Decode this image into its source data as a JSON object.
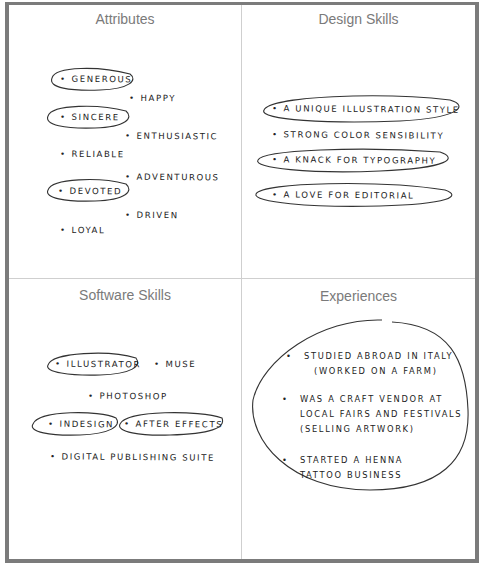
{
  "quadrants": {
    "attributes": {
      "title": "Attributes",
      "items": [
        "Generous",
        "Happy",
        "Sincere",
        "Enthusiastic",
        "Reliable",
        "Adventurous",
        "Devoted",
        "Driven",
        "Loyal"
      ],
      "circled": [
        "Generous",
        "Sincere",
        "Devoted"
      ]
    },
    "design_skills": {
      "title": "Design Skills",
      "items": [
        "A unique illustration style",
        "Strong color sensibility",
        "A knack for typography",
        "A love for editorial"
      ],
      "circled": [
        "A unique illustration style",
        "A knack for typography",
        "A love for editorial"
      ]
    },
    "software_skills": {
      "title": "Software Skills",
      "items": [
        "Illustrator",
        "Muse",
        "Photoshop",
        "InDesign",
        "After Effects",
        "Digital Publishing Suite"
      ],
      "circled": [
        "Illustrator",
        "InDesign",
        "After Effects"
      ]
    },
    "experiences": {
      "title": "Experiences",
      "items": [
        {
          "lines": [
            "Studied abroad in Italy",
            "(worked on a farm)"
          ]
        },
        {
          "lines": [
            "Was a craft vendor at",
            "local fairs and festivals",
            "(selling artwork)"
          ]
        },
        {
          "lines": [
            "Started a henna",
            "tattoo business"
          ]
        }
      ]
    }
  },
  "bullet": "•",
  "colors": {
    "frame": "#7b7b7b",
    "divider": "#cfcfcf",
    "title": "#7a7a7a",
    "ink": "#222222"
  }
}
